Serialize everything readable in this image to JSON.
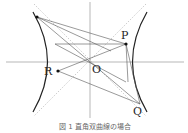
{
  "diagram": {
    "labels": {
      "P": "P",
      "Q": "Q",
      "R": "R",
      "O": "O"
    },
    "caption": "図 1  直角双曲線の場合",
    "colors": {
      "curve": "#222222",
      "line": "#555555",
      "asymptote": "#aaaaaa",
      "axis": "#888888"
    }
  }
}
